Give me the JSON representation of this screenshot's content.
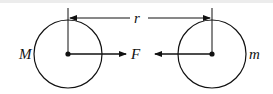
{
  "diagram": {
    "labels": {
      "left_mass": "M",
      "right_mass": "m",
      "force": "F",
      "distance": "r"
    },
    "colors": {
      "stroke": "#111111",
      "background": "#ffffff",
      "top_border": "#ececec"
    }
  }
}
